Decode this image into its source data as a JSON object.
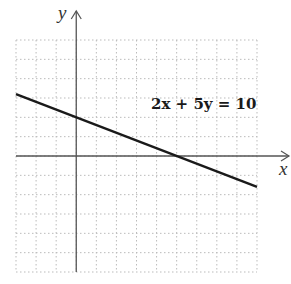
{
  "chart_data": {
    "type": "line",
    "title": "",
    "xlabel": "x",
    "ylabel": "y",
    "xlim": [
      -3,
      9
    ],
    "ylim": [
      -6,
      6
    ],
    "grid": true,
    "grid_style": "dotted",
    "grid_step": 1,
    "tick_labels": false,
    "series": [
      {
        "name": "2x + 5y = 10",
        "equation": "2x + 5y = 10",
        "slope": -0.4,
        "y_intercept": 2,
        "x_intercept": 5,
        "x": [
          -3,
          0,
          5,
          9
        ],
        "y": [
          3.2,
          2,
          0,
          -1.6
        ]
      }
    ],
    "annotations": [
      {
        "text": "2x + 5y = 10",
        "x": 6.5,
        "y": 2.6
      }
    ]
  },
  "labels": {
    "x_axis": "x",
    "y_axis": "y",
    "equation": "2x + 5y = 10"
  },
  "colors": {
    "line": "#1a1a1a",
    "axis": "#555555",
    "grid": "#bbbbbb"
  }
}
